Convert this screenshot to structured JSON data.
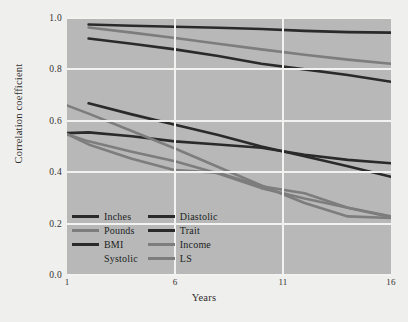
{
  "figure": {
    "caption_fragment": "",
    "background_color": "#efefed",
    "plot_background_color": "#b8b8b8",
    "gridline_color": "#f2f2f0"
  },
  "axes": {
    "y_title": "Correlation coefficient",
    "x_title": "Years",
    "y_ticks": [
      "0.0",
      "0.2",
      "0.4",
      "0.6",
      "0.8",
      "1.0"
    ],
    "x_ticks": [
      "1",
      "6",
      "11",
      "16"
    ]
  },
  "legend": {
    "items": [
      {
        "label": "Inches",
        "color": "#2a2a2a",
        "has_swatch": true
      },
      {
        "label": "Diastolic",
        "color": "#2a2a2a",
        "has_swatch": true
      },
      {
        "label": "Pounds",
        "color": "#7d7d7d",
        "has_swatch": true
      },
      {
        "label": "Trait",
        "color": "#2a2a2a",
        "has_swatch": true
      },
      {
        "label": "BMI",
        "color": "#2a2a2a",
        "has_swatch": true
      },
      {
        "label": "Income",
        "color": "#7d7d7d",
        "has_swatch": true
      },
      {
        "label": "Systolic",
        "color": "#b8b8b8",
        "has_swatch": false
      },
      {
        "label": "LS",
        "color": "#7d7d7d",
        "has_swatch": true
      }
    ]
  },
  "chart_data": {
    "type": "line",
    "title": "",
    "xlabel": "Years",
    "ylabel": "Correlation coefficient",
    "xlim": [
      1,
      16
    ],
    "ylim": [
      0.0,
      1.0
    ],
    "x_ticks": [
      1,
      6,
      11,
      16
    ],
    "y_ticks": [
      0.0,
      0.2,
      0.4,
      0.6,
      0.8,
      1.0
    ],
    "grid": true,
    "legend_position": "inside-lower-left",
    "series": [
      {
        "name": "Inches",
        "color": "#2a2a2a",
        "x": [
          2,
          4,
          6,
          8,
          10,
          12,
          14,
          16
        ],
        "values": [
          0.975,
          0.97,
          0.966,
          0.962,
          0.957,
          0.95,
          0.945,
          0.943
        ]
      },
      {
        "name": "Pounds",
        "color": "#7d7d7d",
        "x": [
          2,
          4,
          6,
          8,
          10,
          12,
          14,
          16
        ],
        "values": [
          0.963,
          0.943,
          0.922,
          0.9,
          0.878,
          0.857,
          0.838,
          0.822
        ]
      },
      {
        "name": "BMI",
        "color": "#2a2a2a",
        "x": [
          2,
          4,
          6,
          8,
          10,
          12,
          14,
          16
        ],
        "values": [
          0.92,
          0.9,
          0.878,
          0.852,
          0.822,
          0.8,
          0.778,
          0.752
        ]
      },
      {
        "name": "Diastolic",
        "color": "#2a2a2a",
        "x": [
          2,
          4,
          6,
          8,
          10,
          12,
          14,
          16
        ],
        "values": [
          0.668,
          0.625,
          0.585,
          0.545,
          0.5,
          0.462,
          0.423,
          0.382
        ]
      },
      {
        "name": "Systolic",
        "color": "#2a2a2a",
        "x": [
          1,
          2,
          4,
          6,
          8,
          10,
          12,
          14,
          16
        ],
        "values": [
          0.552,
          0.555,
          0.54,
          0.52,
          0.508,
          0.495,
          0.468,
          0.448,
          0.435
        ]
      },
      {
        "name": "Trait",
        "color": "#7d7d7d",
        "x": [
          1,
          2,
          4,
          6,
          8,
          10,
          12,
          14,
          16
        ],
        "values": [
          0.548,
          0.52,
          0.48,
          0.443,
          0.395,
          0.338,
          0.298,
          0.262,
          0.228
        ]
      },
      {
        "name": "Income",
        "color": "#7d7d7d",
        "x": [
          1,
          2,
          4,
          6,
          8,
          10,
          12,
          14,
          16
        ],
        "values": [
          0.66,
          0.628,
          0.56,
          0.492,
          0.42,
          0.348,
          0.28,
          0.228,
          0.222
        ]
      },
      {
        "name": "LS",
        "color": "#7d7d7d",
        "x": [
          1,
          2,
          4,
          6,
          8,
          10,
          12,
          14,
          16
        ],
        "values": [
          0.548,
          0.508,
          0.452,
          0.408,
          0.398,
          0.345,
          0.318,
          0.262,
          0.225
        ]
      }
    ]
  }
}
